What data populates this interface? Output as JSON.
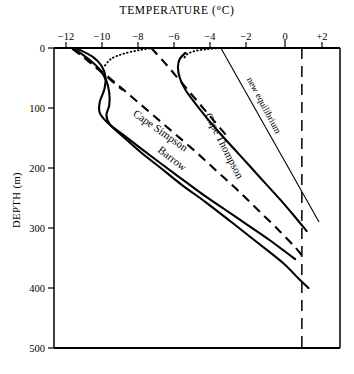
{
  "chart_data": {
    "type": "line",
    "title": "TEMPERATURE (°C)",
    "xlabel": "TEMPERATURE (°C)",
    "ylabel": "DEPTH (m)",
    "xlim": [
      -13,
      2
    ],
    "ylim": [
      0,
      500
    ],
    "y_inverted": true,
    "grid": false,
    "legend": "inline-annotations",
    "xticks": [
      "−12",
      "−10",
      "−8",
      "−6",
      "−4",
      "−2",
      "0",
      "+2"
    ],
    "xtick_values": [
      -12,
      -10,
      -8,
      -6,
      -4,
      -2,
      0,
      2
    ],
    "yticks": [
      "0",
      "100",
      "200",
      "300",
      "400",
      "500"
    ],
    "ytick_values": [
      0,
      100,
      200,
      300,
      400,
      500
    ],
    "series": [
      {
        "name": "Barrow",
        "style": "solid",
        "label": "Barrow",
        "points": [
          [
            -12.0,
            0
          ],
          [
            -11.2,
            18
          ],
          [
            -10.6,
            36
          ],
          [
            -10.25,
            55
          ],
          [
            -10.1,
            75
          ],
          [
            -10.1,
            95
          ],
          [
            -10.25,
            112
          ],
          [
            -10.05,
            128
          ],
          [
            -9.3,
            150
          ],
          [
            -8.4,
            175
          ],
          [
            -7.4,
            200
          ],
          [
            -6.3,
            228
          ],
          [
            -5.0,
            258
          ],
          [
            -3.7,
            290
          ],
          [
            -2.3,
            325
          ],
          [
            -1.0,
            358
          ],
          [
            -0.15,
            385
          ],
          [
            0.35,
            400
          ]
        ]
      },
      {
        "name": "Cape Simpson",
        "style": "solid",
        "label": "Cape Simpson",
        "points": [
          [
            -11.85,
            0
          ],
          [
            -11.0,
            14
          ],
          [
            -10.5,
            30
          ],
          [
            -10.3,
            48
          ],
          [
            -10.35,
            68
          ],
          [
            -10.6,
            90
          ],
          [
            -10.6,
            108
          ],
          [
            -10.2,
            124
          ],
          [
            -9.4,
            144
          ],
          [
            -8.5,
            166
          ],
          [
            -7.5,
            190
          ],
          [
            -6.4,
            216
          ],
          [
            -5.2,
            244
          ],
          [
            -4.0,
            270
          ],
          [
            -2.8,
            296
          ],
          [
            -1.7,
            320
          ],
          [
            -0.85,
            340
          ],
          [
            -0.35,
            352
          ]
        ]
      },
      {
        "name": "Cape Simpson upper dotted",
        "style": "dotted",
        "points": [
          [
            -7.8,
            0
          ],
          [
            -8.6,
            4
          ],
          [
            -9.4,
            10
          ],
          [
            -10.0,
            18
          ],
          [
            -10.35,
            30
          ]
        ]
      },
      {
        "name": "Cape Thompson",
        "style": "solid",
        "label": "Cape Thompson",
        "points": [
          [
            -6.1,
            8
          ],
          [
            -6.4,
            18
          ],
          [
            -6.5,
            32
          ],
          [
            -6.4,
            50
          ],
          [
            -6.1,
            70
          ],
          [
            -5.6,
            92
          ],
          [
            -5.0,
            116
          ],
          [
            -4.3,
            142
          ],
          [
            -3.5,
            170
          ],
          [
            -2.7,
            198
          ],
          [
            -1.9,
            226
          ],
          [
            -1.1,
            254
          ],
          [
            -0.4,
            280
          ],
          [
            0.25,
            305
          ]
        ]
      },
      {
        "name": "Cape Thompson upper dotted",
        "style": "dotted",
        "points": [
          [
            -4.3,
            0
          ],
          [
            -5.0,
            2
          ],
          [
            -5.6,
            5
          ],
          [
            -6.0,
            10
          ],
          [
            -6.2,
            18
          ]
        ]
      },
      {
        "name": "new equilibrium",
        "style": "thin-solid",
        "label": "new equilibrium",
        "points": [
          [
            -4.25,
            0
          ],
          [
            0.9,
            290
          ]
        ]
      },
      {
        "name": "steady-state gradient A",
        "style": "dashed",
        "points": [
          [
            -12.05,
            1
          ],
          [
            -11.0,
            26
          ],
          [
            -9.9,
            55
          ],
          [
            -8.9,
            82
          ],
          [
            -7.8,
            112
          ],
          [
            -6.7,
            142
          ],
          [
            -5.6,
            172
          ],
          [
            -4.5,
            204
          ],
          [
            -3.4,
            236
          ],
          [
            -2.3,
            270
          ],
          [
            -1.2,
            304
          ],
          [
            -0.3,
            334
          ],
          [
            0.15,
            352
          ]
        ]
      },
      {
        "name": "steady-state gradient B",
        "style": "dashed",
        "points": [
          [
            -12.0,
            1
          ],
          [
            -11.2,
            22
          ],
          [
            -10.3,
            46
          ],
          [
            -9.4,
            70
          ]
        ]
      },
      {
        "name": "steady-state gradient C",
        "style": "dashed",
        "points": [
          [
            -7.9,
            0
          ],
          [
            -7.1,
            28
          ],
          [
            -6.3,
            58
          ],
          [
            -5.5,
            88
          ],
          [
            -4.7,
            118
          ],
          [
            -3.9,
            148
          ]
        ]
      },
      {
        "name": "zero isotherm",
        "style": "long-dash",
        "points": [
          [
            0,
            0
          ],
          [
            0,
            500
          ]
        ]
      }
    ],
    "annotations": [
      {
        "text": "Cape Simpson",
        "x": -8.9,
        "y": 112,
        "rotation": 35
      },
      {
        "text": "Cape Thompson",
        "x": -5.1,
        "y": 112,
        "rotation": 63
      },
      {
        "text": "Barrow",
        "x": -7.6,
        "y": 172,
        "rotation": 38
      },
      {
        "text": "new equilibrium",
        "x": -2.9,
        "y": 52,
        "rotation": 62
      }
    ]
  }
}
